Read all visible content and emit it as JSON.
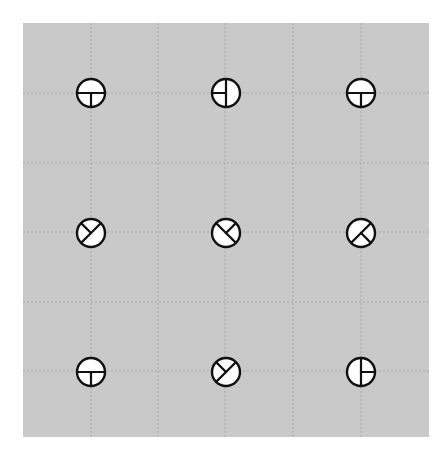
{
  "figure": {
    "background_color": "#c9c9c9",
    "page_color": "#ffffff",
    "grid_color": "#a8a8a8",
    "symbol_stroke": "#111111",
    "symbol_fill": "#ffffff",
    "grid": {
      "vertical_x": [
        91,
        158,
        225,
        293,
        361
      ],
      "horizontal_y": [
        93,
        163,
        232,
        302,
        371
      ]
    },
    "symbols": [
      {
        "row": 0,
        "col": 0,
        "cx": 91,
        "cy": 93,
        "rays": [
          0,
          90,
          180
        ]
      },
      {
        "row": 0,
        "col": 1,
        "cx": 226,
        "cy": 93,
        "rays": [
          270,
          180,
          90
        ]
      },
      {
        "row": 0,
        "col": 2,
        "cx": 361,
        "cy": 93,
        "rays": [
          0,
          90,
          180
        ]
      },
      {
        "row": 1,
        "col": 0,
        "cx": 91,
        "cy": 233,
        "rays": [
          225,
          315,
          135
        ]
      },
      {
        "row": 1,
        "col": 1,
        "cx": 226,
        "cy": 233,
        "rays": [
          225,
          315,
          45
        ]
      },
      {
        "row": 1,
        "col": 2,
        "cx": 361,
        "cy": 233,
        "rays": [
          315,
          135,
          45
        ]
      },
      {
        "row": 2,
        "col": 0,
        "cx": 91,
        "cy": 372,
        "rays": [
          0,
          90,
          180
        ]
      },
      {
        "row": 2,
        "col": 1,
        "cx": 226,
        "cy": 372,
        "rays": [
          225,
          315,
          135
        ]
      },
      {
        "row": 2,
        "col": 2,
        "cx": 361,
        "cy": 372,
        "rays": [
          270,
          0,
          90
        ]
      }
    ],
    "symbol_radius": 14
  }
}
